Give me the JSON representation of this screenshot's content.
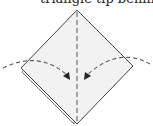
{
  "caption": {
    "text": "triangle tip behind the"
  },
  "diagram": {
    "type": "origami-fold-step",
    "paper_color": "#f2f2f2",
    "line_color": "#444444",
    "elements": [
      "square-base-diamond",
      "vertical-valley-fold-line",
      "left-fold-arrow",
      "right-fold-arrow"
    ]
  }
}
